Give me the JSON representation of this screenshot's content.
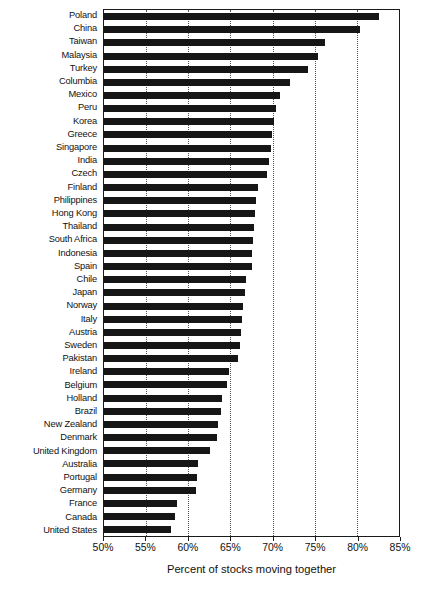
{
  "chart_data": {
    "type": "bar",
    "orientation": "horizontal",
    "title": "",
    "xlabel": "Percent of stocks moving together",
    "ylabel": "",
    "xlim": [
      50,
      85
    ],
    "xtick_labels": [
      "50%",
      "55%",
      "60%",
      "65%",
      "70%",
      "75%",
      "80%",
      "85%"
    ],
    "xticks": [
      50,
      55,
      60,
      65,
      70,
      75,
      80,
      85
    ],
    "grid": true,
    "grid_axis": "x",
    "grid_style": "dotted",
    "legend": "none",
    "bar_color": "#161616",
    "categories": [
      "Poland",
      "China",
      "Taiwan",
      "Malaysia",
      "Turkey",
      "Columbia",
      "Mexico",
      "Peru",
      "Korea",
      "Greece",
      "Singapore",
      "India",
      "Czech",
      "Finland",
      "Philippines",
      "Hong Kong",
      "Thailand",
      "South Africa",
      "Indonesia",
      "Spain",
      "Chile",
      "Japan",
      "Norway",
      "Italy",
      "Austria",
      "Sweden",
      "Pakistan",
      "Ireland",
      "Belgium",
      "Holland",
      "Brazil",
      "New Zealand",
      "Denmark",
      "United Kingdom",
      "Australia",
      "Portugal",
      "Germany",
      "France",
      "Canada",
      "United States"
    ],
    "values": [
      82.6,
      80.4,
      76.2,
      75.4,
      74.2,
      72.1,
      70.9,
      70.4,
      70.2,
      69.9,
      69.8,
      69.6,
      69.3,
      68.3,
      68.0,
      67.9,
      67.8,
      67.7,
      67.6,
      67.5,
      66.9,
      66.7,
      66.5,
      66.4,
      66.2,
      66.1,
      65.9,
      64.8,
      64.6,
      64.0,
      63.9,
      63.5,
      63.4,
      62.6,
      61.2,
      61.0,
      60.9,
      58.7,
      58.4,
      57.9
    ]
  },
  "axis": {
    "x_title": "Percent of stocks moving together"
  }
}
